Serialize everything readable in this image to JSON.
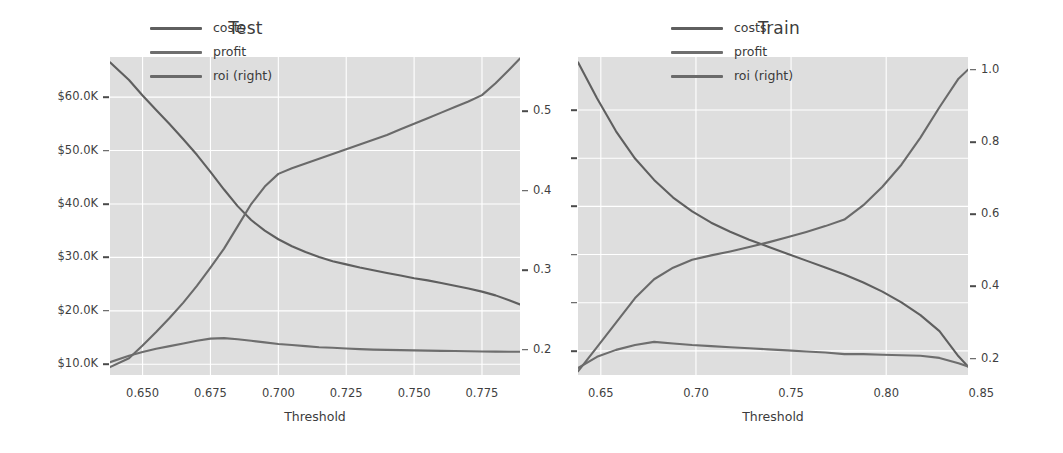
{
  "figure": {
    "background_color": "#ffffff",
    "plot_background_color": "#dedede",
    "gridline_color": "#ffffff"
  },
  "colors": {
    "costs": "#5f5f5f",
    "profit": "#6e6e6e",
    "roi": "#6a6a6a",
    "text": "#3c3c3c",
    "tick": "#4a4a4a"
  },
  "legend": {
    "items": [
      {
        "label": "costs",
        "color": "#5f5f5f"
      },
      {
        "label": "profit",
        "color": "#6e6e6e"
      },
      {
        "label": "roi (right)",
        "color": "#6a6a6a"
      }
    ]
  },
  "panels": [
    {
      "id": "test",
      "title": "Test",
      "xlabel": "Threshold",
      "xticks": [
        "0.650",
        "0.675",
        "0.700",
        "0.725",
        "0.750",
        "0.775"
      ],
      "xtick_values": [
        0.65,
        0.675,
        0.7,
        0.725,
        0.75,
        0.775
      ],
      "left_yticks": [
        "$60.0K",
        "$50.0K",
        "$40.0K",
        "$30.0K",
        "$20.0K",
        "$10.0K"
      ],
      "left_ytick_values": [
        60000,
        50000,
        40000,
        30000,
        20000,
        10000
      ],
      "right_yticks": [
        "0.5",
        "0.4",
        "0.3",
        "0.2"
      ],
      "right_ytick_values": [
        0.5,
        0.4,
        0.3,
        0.2
      ]
    },
    {
      "id": "train",
      "title": "Train",
      "xlabel": "Threshold",
      "xticks": [
        "0.65",
        "0.70",
        "0.75",
        "0.80",
        "0.85"
      ],
      "xtick_values": [
        0.65,
        0.7,
        0.75,
        0.8,
        0.85
      ],
      "left_yticks": [
        "",
        "",
        "",
        "",
        "",
        ""
      ],
      "left_ytick_values": [],
      "right_yticks": [
        "1.0",
        "0.8",
        "0.6",
        "0.4",
        "0.2"
      ],
      "right_ytick_values": [
        1.0,
        0.8,
        0.6,
        0.4,
        0.2
      ]
    }
  ],
  "chart_data": [
    {
      "type": "line",
      "title": "Test",
      "xlabel": "Threshold",
      "ylabel": "",
      "ylabel_right": "roi",
      "xlim": [
        0.638,
        0.789
      ],
      "ylim": [
        8000,
        67500
      ],
      "ylim_right": [
        0.168,
        0.568
      ],
      "grid": true,
      "legend_position": "upper center",
      "x": [
        0.638,
        0.645,
        0.65,
        0.655,
        0.66,
        0.665,
        0.67,
        0.675,
        0.68,
        0.685,
        0.69,
        0.695,
        0.7,
        0.705,
        0.71,
        0.715,
        0.72,
        0.725,
        0.73,
        0.735,
        0.74,
        0.745,
        0.75,
        0.755,
        0.76,
        0.765,
        0.77,
        0.775,
        0.78,
        0.785,
        0.789
      ],
      "series": [
        {
          "name": "costs",
          "axis": "left",
          "color": "#5f5f5f",
          "values": [
            66500,
            63200,
            60300,
            57600,
            54900,
            52100,
            49200,
            46000,
            42700,
            39600,
            37000,
            35000,
            33400,
            32100,
            31000,
            30100,
            29300,
            28700,
            28100,
            27600,
            27100,
            26600,
            26100,
            25700,
            25200,
            24700,
            24200,
            23600,
            22900,
            22000,
            21200
          ]
        },
        {
          "name": "profit",
          "axis": "left",
          "color": "#6e6e6e",
          "values": [
            10400,
            11600,
            12300,
            12900,
            13400,
            13900,
            14400,
            14800,
            14900,
            14700,
            14400,
            14100,
            13800,
            13600,
            13400,
            13200,
            13100,
            12950,
            12850,
            12750,
            12700,
            12650,
            12600,
            12560,
            12520,
            12480,
            12440,
            12400,
            12380,
            12360,
            12350
          ]
        },
        {
          "name": "roi (right)",
          "axis": "right",
          "color": "#6a6a6a",
          "values": [
            0.178,
            0.189,
            0.205,
            0.222,
            0.24,
            0.259,
            0.28,
            0.303,
            0.327,
            0.355,
            0.383,
            0.405,
            0.421,
            0.428,
            0.434,
            0.44,
            0.446,
            0.452,
            0.458,
            0.464,
            0.47,
            0.477,
            0.484,
            0.491,
            0.498,
            0.505,
            0.512,
            0.52,
            0.535,
            0.552,
            0.566
          ]
        }
      ]
    },
    {
      "type": "line",
      "title": "Train",
      "xlabel": "Threshold",
      "ylabel": "",
      "ylabel_right": "roi",
      "xlim": [
        0.638,
        0.843
      ],
      "ylim": [
        8000,
        67500
      ],
      "ylim_right": [
        0.155,
        1.035
      ],
      "grid": true,
      "legend_position": "upper center",
      "x": [
        0.638,
        0.648,
        0.658,
        0.668,
        0.678,
        0.688,
        0.698,
        0.708,
        0.718,
        0.728,
        0.738,
        0.748,
        0.758,
        0.768,
        0.778,
        0.788,
        0.798,
        0.808,
        0.818,
        0.828,
        0.838,
        0.843
      ],
      "series": [
        {
          "name": "costs",
          "axis": "left",
          "color": "#5f5f5f",
          "values": [
            66500,
            59800,
            53600,
            48500,
            44500,
            41200,
            38600,
            36500,
            34800,
            33300,
            32000,
            30700,
            29400,
            28100,
            26800,
            25300,
            23600,
            21600,
            19200,
            16200,
            11500,
            9600
          ]
        },
        {
          "name": "profit",
          "axis": "left",
          "color": "#6e6e6e",
          "values": [
            9300,
            11400,
            12700,
            13600,
            14200,
            13900,
            13600,
            13400,
            13200,
            13000,
            12800,
            12600,
            12400,
            12200,
            11900,
            11900,
            11800,
            11700,
            11600,
            11200,
            10200,
            9600
          ]
        },
        {
          "name": "roi (right)",
          "axis": "right",
          "color": "#6a6a6a",
          "values": [
            0.165,
            0.232,
            0.3,
            0.368,
            0.42,
            0.452,
            0.474,
            0.486,
            0.497,
            0.509,
            0.522,
            0.536,
            0.551,
            0.567,
            0.585,
            0.625,
            0.676,
            0.737,
            0.812,
            0.896,
            0.975,
            1.0
          ]
        }
      ]
    }
  ]
}
